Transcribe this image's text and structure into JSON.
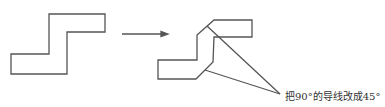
{
  "diagram": {
    "before_shape": "90-degree-trace",
    "after_shape": "45-degree-trace",
    "annotation": "把90°的导线改成45°",
    "stroke_color": "#555555"
  }
}
